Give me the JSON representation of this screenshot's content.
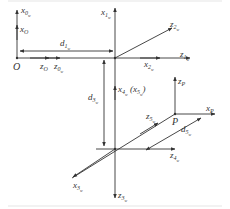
{
  "diagram": {
    "colors": {
      "line": "#333333",
      "background": "#ffffff"
    },
    "labels": {
      "x0": {
        "base": "x",
        "sub": "0",
        "sub2": "w"
      },
      "xO": {
        "base": "x",
        "sub": "O"
      },
      "O": "O",
      "zO": {
        "base": "z",
        "sub": "O"
      },
      "z0": {
        "base": "z",
        "sub": "0",
        "sub2": "w"
      },
      "d1": {
        "base": "d",
        "sub": "1",
        "sub2": "w"
      },
      "x1": {
        "base": "x",
        "sub": "1",
        "sub2": "w"
      },
      "z1": {
        "base": "z",
        "sub": "1",
        "sub2": "w"
      },
      "z2": {
        "base": "z",
        "sub": "2",
        "sub2": "w"
      },
      "x2": {
        "base": "x",
        "sub": "2",
        "sub2": "w"
      },
      "d3": {
        "base": "d",
        "sub": "3",
        "sub2": "w"
      },
      "x4": {
        "base": "x",
        "sub": "4",
        "sub2": "w"
      },
      "x5_paren": {
        "base": "x",
        "sub": "5",
        "sub2": "w"
      },
      "zP": {
        "base": "z",
        "sub": "P"
      },
      "xP": {
        "base": "x",
        "sub": "P"
      },
      "P": "P",
      "z5": {
        "base": "z",
        "sub": "5",
        "sub2": "w"
      },
      "d5": {
        "base": "d",
        "sub": "5",
        "sub2": "w"
      },
      "z4": {
        "base": "z",
        "sub": "4",
        "sub2": "w"
      },
      "x3": {
        "base": "x",
        "sub": "3",
        "sub2": "w"
      },
      "z3": {
        "base": "z",
        "sub": "3",
        "sub2": "w"
      }
    }
  }
}
